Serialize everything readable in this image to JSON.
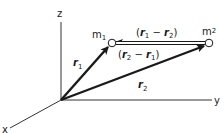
{
  "diagram": {
    "axes": {
      "z_label": "z",
      "y_label": "y",
      "x_label": "x"
    },
    "masses": [
      {
        "label": "m",
        "subscript": "1"
      },
      {
        "label": "m",
        "subscript": "2"
      }
    ],
    "vectors": {
      "r1": {
        "symbol": "r",
        "subscript": "1"
      },
      "r2": {
        "symbol": "r",
        "subscript": "2"
      },
      "r1_minus_r2": {
        "open": "(",
        "a": "r",
        "a_sub": "1",
        "op": " − ",
        "b": "r",
        "b_sub": "2",
        "close": ")"
      },
      "r2_minus_r1": {
        "open": "(",
        "a": "r",
        "a_sub": "2",
        "op": " − ",
        "b": "r",
        "b_sub": "1",
        "close": ")"
      }
    },
    "colors": {
      "ink": "#1a1a1a",
      "axis": "#333333",
      "background": "#ffffff"
    }
  }
}
